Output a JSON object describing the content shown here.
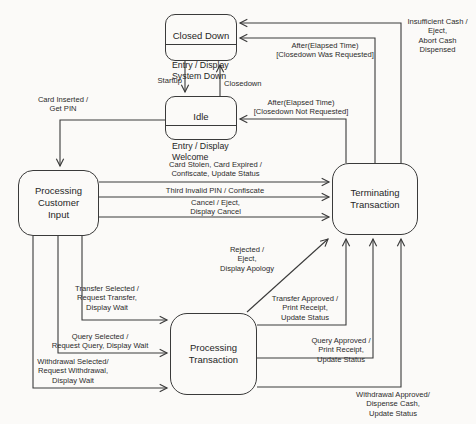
{
  "diagram": {
    "colors": {
      "line": "#3a3a3a",
      "background": "#fbfaf8",
      "text": "#262626"
    },
    "states": {
      "closed_down": {
        "title": "Closed Down",
        "body": "Entry / Display\nSystem Down"
      },
      "idle": {
        "title": "Idle",
        "body": "Entry / Display\nWelcome"
      },
      "processing_customer_input": {
        "title": "Processing\nCustomer\nInput"
      },
      "terminating_transaction": {
        "title": "Terminating\nTransaction"
      },
      "processing_transaction": {
        "title": "Processing\nTransaction"
      }
    },
    "transitions": {
      "startup": "Startup",
      "closedown": "Closedown",
      "card_inserted": "Card Inserted /\nGet PIN",
      "card_stolen": "Card Stolen, Card Expired /\nConfiscate, Update Status",
      "third_invalid_pin": "Third Invalid PIN / Confiscate",
      "cancel": "Cancel / Eject,\nDisplay Cancel",
      "after_not_requested": "After(Elapsed Time)\n[Closedown Not Requested]",
      "after_was_requested": "After(Elapsed Time)\n[Closedown Was Requested]",
      "insufficient_cash": "Insufficient Cash /\nEject,\nAbort Cash\nDispensed",
      "rejected": "Rejected /\nEject,\nDisplay Apology",
      "transfer_selected": "Transfer Selected /\nRequest Transfer,\nDisplay Wait",
      "query_selected": "Query Selected /\nRequest Query, Display Wait",
      "withdrawal_selected": "Withdrawal Selected/\nRequest Withdrawal,\nDisplay Wait",
      "transfer_approved": "Transfer Approved /\nPrint Receipt,\nUpdate Status",
      "query_approved": "Query Approved /\nPrint Receipt,\nUpdate Status",
      "withdrawal_approved": "Withdrawal Approved/\nDispense Cash,\nUpdate Status"
    }
  }
}
